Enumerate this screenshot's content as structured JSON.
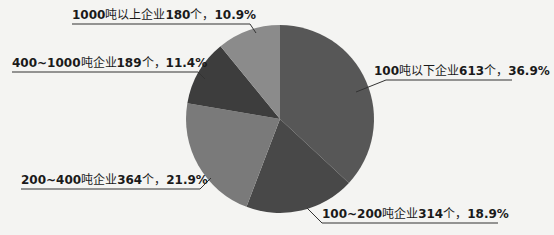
{
  "chart_data": {
    "type": "pie",
    "title": "",
    "categories": [
      "100吨以下企业",
      "100~200吨企业",
      "200~400吨企业",
      "400~1000吨企业",
      "1000吨以上企业"
    ],
    "counts": [
      613,
      314,
      364,
      189,
      180
    ],
    "values": [
      36.9,
      18.9,
      21.9,
      11.4,
      10.9
    ],
    "colors": [
      "#575757",
      "#484848",
      "#7a7a7a",
      "#3d3d3d",
      "#8b8b8b"
    ],
    "legend": "none",
    "labels": [
      {
        "range": "100",
        "unit": "吨以下企业",
        "count": "613",
        "suffix": "个，",
        "pct": "36.9%"
      },
      {
        "range": "100~200",
        "unit": "吨企业",
        "count": "314",
        "suffix": "个，",
        "pct": "18.9%"
      },
      {
        "range": "200~400",
        "unit": "吨企业",
        "count": "364",
        "suffix": "个，",
        "pct": "21.9%"
      },
      {
        "range": "400~1000",
        "unit": "吨企业",
        "count": "189",
        "suffix": "个，",
        "pct": "11.4%"
      },
      {
        "range": "1000",
        "unit": "吨以上企业",
        "count": "180",
        "suffix": "个，",
        "pct": "10.9%"
      }
    ]
  }
}
